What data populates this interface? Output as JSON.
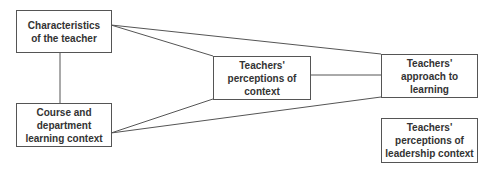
{
  "nodes": [
    {
      "id": "teacher",
      "label": "Characteristics\nof the teacher"
    },
    {
      "id": "course",
      "label": "Course and\ndepartment\nlearning context"
    },
    {
      "id": "perceptions",
      "label": "Teachers'\nperceptions of\ncontext"
    },
    {
      "id": "approach",
      "label": "Teachers'\napproach to\nlearning"
    },
    {
      "id": "leadership",
      "label": "Teachers'\nperceptions of\nleadership context"
    }
  ],
  "edges": [
    {
      "from": "teacher",
      "to": "course"
    },
    {
      "from": "teacher",
      "to": "perceptions"
    },
    {
      "from": "teacher",
      "to": "approach"
    },
    {
      "from": "course",
      "to": "perceptions"
    },
    {
      "from": "course",
      "to": "approach"
    },
    {
      "from": "perceptions",
      "to": "approach"
    }
  ]
}
